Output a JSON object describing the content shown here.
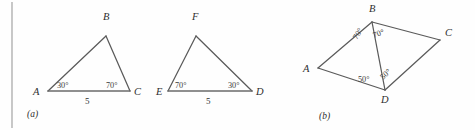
{
  "figure": {
    "background_color": "#fefefe",
    "stroke_color": "#5a5a5a",
    "text_color": "#2e2e2e",
    "panels": [
      {
        "caption": "(a)",
        "shapes": [
          {
            "name": "triangle-abc",
            "vertices": [
              {
                "label": "A",
                "x": 48,
                "y": 91
              },
              {
                "label": "B",
                "x": 106,
                "y": 36
              },
              {
                "label": "C",
                "x": 130,
                "y": 91
              }
            ],
            "angles": [
              {
                "at": "A",
                "value": "30°"
              },
              {
                "at": "C",
                "value": "70°"
              }
            ],
            "sides": [
              {
                "between": "AC",
                "value": "5"
              }
            ]
          },
          {
            "name": "triangle-efd",
            "vertices": [
              {
                "label": "E",
                "x": 168,
                "y": 91
              },
              {
                "label": "F",
                "x": 196,
                "y": 36
              },
              {
                "label": "D",
                "x": 252,
                "y": 91
              }
            ],
            "angles": [
              {
                "at": "E",
                "value": "70°"
              },
              {
                "at": "D",
                "value": "30°"
              }
            ],
            "sides": [
              {
                "between": "ED",
                "value": "5"
              }
            ]
          }
        ]
      },
      {
        "caption": "(b)",
        "shapes": [
          {
            "name": "quadrilateral-abcd",
            "vertices": [
              {
                "label": "A",
                "x": 318,
                "y": 68
              },
              {
                "label": "B",
                "x": 372,
                "y": 22
              },
              {
                "label": "C",
                "x": 440,
                "y": 40
              },
              {
                "label": "D",
                "x": 385,
                "y": 90
              }
            ],
            "diagonal": "BD",
            "angles": [
              {
                "at": "B",
                "part": "ABD",
                "value": "70°"
              },
              {
                "at": "B",
                "part": "DBC",
                "value": "70°"
              },
              {
                "at": "D",
                "part": "ADB",
                "value": "50°"
              },
              {
                "at": "D",
                "part": "BDC",
                "value": "50°"
              }
            ]
          }
        ]
      }
    ],
    "labels": {
      "a_vertex_A": "A",
      "a_vertex_B": "B",
      "a_vertex_C": "C",
      "a_angle_A": "30°",
      "a_angle_C": "70°",
      "a_side_AC": "5",
      "a_vertex_E": "E",
      "a_vertex_F": "F",
      "a_vertex_D": "D",
      "a_angle_E": "70°",
      "a_angle_D": "30°",
      "a_side_ED": "5",
      "caption_a": "(a)",
      "b_vertex_A": "A",
      "b_vertex_B": "B",
      "b_vertex_C": "C",
      "b_vertex_D": "D",
      "b_angle_ABD": "70°",
      "b_angle_DBC": "70°",
      "b_angle_ADB": "50°",
      "b_angle_BDC": "50°",
      "caption_b": "(b)"
    }
  }
}
